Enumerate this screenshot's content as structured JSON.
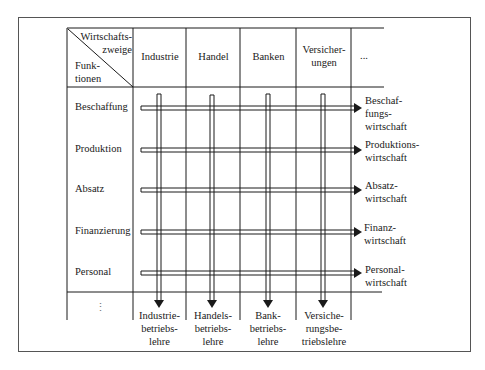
{
  "corner_header": {
    "top_label_line1": "Wirtschafts-",
    "top_label_line2": "zweige",
    "bottom_label_line1": "Funk-",
    "bottom_label_line2": "tionen"
  },
  "columns": [
    {
      "line1": "Industrie",
      "line2": ""
    },
    {
      "line1": "Handel",
      "line2": ""
    },
    {
      "line1": "Banken",
      "line2": ""
    },
    {
      "line1": "Versicher-",
      "line2": "ungen"
    },
    {
      "line1": "...",
      "line2": ""
    }
  ],
  "rows": [
    {
      "label": "Beschaffung",
      "result": [
        "Beschaf-",
        "fungs-",
        "wirtschaft"
      ]
    },
    {
      "label": "Produktion",
      "result": [
        "Produktions-",
        "wirtschaft"
      ]
    },
    {
      "label": "Absatz",
      "result": [
        "Absatz-",
        "wirtschaft"
      ]
    },
    {
      "label": "Finanzierung",
      "result": [
        "Finanz-",
        "wirtschaft"
      ]
    },
    {
      "label": "Personal",
      "result": [
        "Personal-",
        "wirtschaft"
      ]
    }
  ],
  "bottom_row": {
    "label": "⋮",
    "results": [
      [
        "Industrie-",
        "betriebs-",
        "lehre"
      ],
      [
        "Handels-",
        "betriebs-",
        "lehre"
      ],
      [
        "Bank-",
        "betriebs-",
        "lehre"
      ],
      [
        "Versiche-",
        "rungsbe-",
        "triebslehre"
      ]
    ]
  },
  "colors": {
    "line": "#1a1a1a",
    "frame": "#555555"
  }
}
